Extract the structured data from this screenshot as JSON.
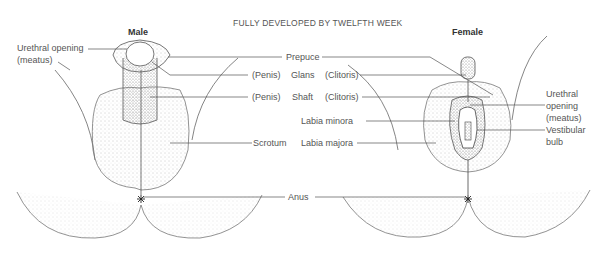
{
  "title": "FULLY DEVELOPED BY  TWELFTH WEEK",
  "male": {
    "heading": "Male",
    "urethral_opening": [
      "Urethral opening",
      "(meatus)"
    ],
    "penis_glans": "(Penis)",
    "penis_shaft": "(Penis)",
    "scrotum": "Scrotum"
  },
  "female": {
    "heading": "Female",
    "clitoris_glans": "(Clitoris)",
    "clitoris_shaft": "(Clitoris)",
    "labia_minora": "Labia minora",
    "labia_majora": "Labia majora",
    "urethral_opening": [
      "Urethral",
      "opening",
      "(meatus)"
    ],
    "vestibular_bulb": [
      "Vestibular",
      "bulb"
    ]
  },
  "shared": {
    "prepuce": "Prepuce",
    "glans": "Glans",
    "shaft": "Shaft",
    "anus": "Anus"
  },
  "colors": {
    "line": "#555555",
    "stipple": "#888888",
    "text": "#555555"
  }
}
